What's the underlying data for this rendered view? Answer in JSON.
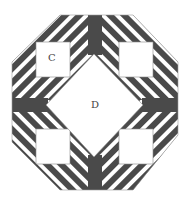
{
  "diagram": {
    "type": "quilt-block",
    "shape": "octagon",
    "colors": {
      "dark": "#4a4a4a",
      "light": "#ffffff",
      "outline": "#9a9a9a"
    },
    "labels": [
      {
        "id": "C",
        "text": "C",
        "piece": "corner-square-top-left"
      },
      {
        "id": "D",
        "text": "D",
        "piece": "center-diamond"
      }
    ],
    "pieces": {
      "corner_squares": 4,
      "center_diamond": 1,
      "star_points": 4
    }
  }
}
